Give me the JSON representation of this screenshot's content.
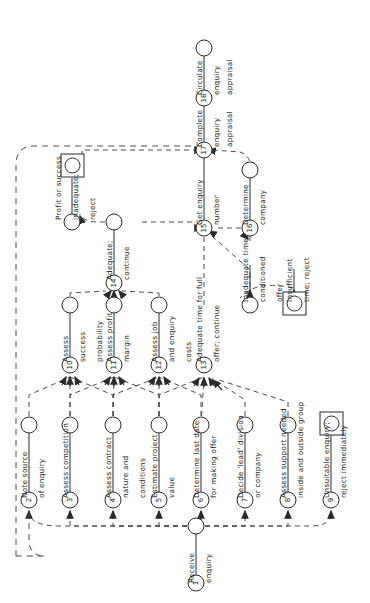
{
  "diagram": {
    "orientation": "rotated-90-ccw",
    "colors": {
      "line": "#2b2b2b",
      "text": "#1a1a1a",
      "background": "#ffffff",
      "dashed": "#4a4a4a"
    },
    "nodes": [
      {
        "id": "1",
        "num": "1",
        "cx": 196,
        "cy": 583,
        "shape": "circle"
      },
      {
        "id": "2",
        "num": "2",
        "cx": 29,
        "cy": 500,
        "shape": "circle"
      },
      {
        "id": "3",
        "num": "3",
        "cx": 70,
        "cy": 500,
        "shape": "circle"
      },
      {
        "id": "4",
        "num": "4",
        "cx": 113,
        "cy": 500,
        "shape": "circle"
      },
      {
        "id": "5",
        "num": "5",
        "cx": 159,
        "cy": 500,
        "shape": "circle"
      },
      {
        "id": "6",
        "num": "6",
        "cx": 201,
        "cy": 500,
        "shape": "circle"
      },
      {
        "id": "7",
        "num": "7",
        "cx": 245,
        "cy": 500,
        "shape": "circle"
      },
      {
        "id": "8",
        "num": "8",
        "cx": 288,
        "cy": 500,
        "shape": "circle"
      },
      {
        "id": "9",
        "num": "9",
        "cx": 331,
        "cy": 500,
        "shape": "circle"
      },
      {
        "id": "10",
        "num": "10",
        "cx": 70,
        "cy": 365,
        "shape": "circle"
      },
      {
        "id": "11",
        "num": "11",
        "cx": 114,
        "cy": 365,
        "shape": "circle"
      },
      {
        "id": "12",
        "num": "12",
        "cx": 159,
        "cy": 365,
        "shape": "circle"
      },
      {
        "id": "13",
        "num": "13",
        "cx": 204,
        "cy": 365,
        "shape": "circle"
      },
      {
        "id": "14",
        "num": "14",
        "cx": 114,
        "cy": 283,
        "shape": "circle"
      },
      {
        "id": "15",
        "num": "15",
        "cx": 204,
        "cy": 228,
        "shape": "circle"
      },
      {
        "id": "16",
        "num": "16",
        "cx": 250,
        "cy": 228,
        "shape": "circle"
      },
      {
        "id": "17",
        "num": "17",
        "cx": 204,
        "cy": 150,
        "shape": "circle"
      },
      {
        "id": "18",
        "num": "18",
        "cx": 204,
        "cy": 98,
        "shape": "circle"
      }
    ],
    "endpoints": [
      {
        "id": "e2",
        "cx": 29,
        "cy": 425,
        "shape": "open-circle"
      },
      {
        "id": "e3",
        "cx": 70,
        "cy": 425,
        "shape": "open-circle"
      },
      {
        "id": "e4",
        "cx": 113,
        "cy": 425,
        "shape": "open-circle"
      },
      {
        "id": "e5",
        "cx": 159,
        "cy": 425,
        "shape": "open-circle"
      },
      {
        "id": "e6",
        "cx": 201,
        "cy": 425,
        "shape": "open-circle"
      },
      {
        "id": "e7",
        "cx": 245,
        "cy": 425,
        "shape": "open-circle"
      },
      {
        "id": "e8",
        "cx": 288,
        "cy": 425,
        "shape": "open-circle"
      },
      {
        "id": "e9",
        "cx": 331,
        "cy": 425,
        "shape": "square-circle"
      },
      {
        "id": "e10",
        "cx": 70,
        "cy": 305,
        "shape": "open-circle"
      },
      {
        "id": "e11",
        "cx": 114,
        "cy": 305,
        "shape": "open-circle"
      },
      {
        "id": "e12",
        "cx": 159,
        "cy": 305,
        "shape": "open-circle"
      },
      {
        "id": "e13a",
        "cx": 250,
        "cy": 305,
        "shape": "open-circle"
      },
      {
        "id": "e13b",
        "cx": 294,
        "cy": 305,
        "shape": "square-circle"
      },
      {
        "id": "e14",
        "cx": 114,
        "cy": 222,
        "shape": "open-circle"
      },
      {
        "id": "e14r",
        "cx": 72,
        "cy": 222,
        "shape": "open-circle"
      },
      {
        "id": "e14x",
        "cx": 72,
        "cy": 165,
        "shape": "square-circle"
      },
      {
        "id": "e16",
        "cx": 250,
        "cy": 170,
        "shape": "open-circle"
      },
      {
        "id": "e1",
        "cx": 196,
        "cy": 526,
        "shape": "open-circle"
      },
      {
        "id": "e18",
        "cx": 204,
        "cy": 48,
        "shape": "open-circle"
      }
    ],
    "activities": [
      {
        "node": "1",
        "line1": "Receive",
        "line2": "enquiry"
      },
      {
        "node": "2",
        "line1": "Note source",
        "line2": "of enquiry"
      },
      {
        "node": "3",
        "line1": "Assess competition",
        "line2": ""
      },
      {
        "node": "4",
        "line1": "Assess contract",
        "line2": "nature and",
        "line3": "conditions"
      },
      {
        "node": "5",
        "line1": "Estimate project",
        "line2": "value"
      },
      {
        "node": "6",
        "line1": "Determine last date",
        "line2": "for making offer"
      },
      {
        "node": "7",
        "line1": "Decide 'lead' division",
        "line2": "or company"
      },
      {
        "node": "8",
        "line1": "Assess support needed",
        "line2": "inside and outside group"
      },
      {
        "node": "9",
        "line1": "Unsuitable enquiry;",
        "line2": "reject immediately"
      },
      {
        "node": "10",
        "line1": "Assess",
        "line2": "success",
        "line3": "probability"
      },
      {
        "node": "11",
        "line1": "Assess profit",
        "line2": "margin"
      },
      {
        "node": "12",
        "line1": "Assess job",
        "line2": "and enquiry",
        "line3": "costs"
      },
      {
        "node": "13",
        "line1": "Adequate time for full",
        "line2": "offer; continue"
      },
      {
        "node": "13b",
        "line1": "Inadequate time;",
        "line2": "conditioned",
        "line3": "offer"
      },
      {
        "node": "13c",
        "line1": "Insufficient",
        "line2": "time; reject"
      },
      {
        "node": "14",
        "line1": "Adequate;",
        "line2": "continue"
      },
      {
        "node": "14b",
        "line1": "Profit or success",
        "line2": "inadequate;",
        "line3": "reject"
      },
      {
        "node": "15",
        "line1": "Get enquiry",
        "line2": "number"
      },
      {
        "node": "16",
        "line1": "Determine",
        "line2": "company"
      },
      {
        "node": "17",
        "line1": "Complete",
        "line2": "enquiry",
        "line3": "appraisal"
      },
      {
        "node": "18",
        "line1": "Circulate",
        "line2": "enquiry",
        "line3": "appraisal"
      }
    ],
    "labels": [
      {
        "id": "t1a",
        "text": "Receive",
        "x": 188,
        "y": 583
      },
      {
        "id": "t1b",
        "text": "enquiry",
        "x": 205,
        "y": 583
      },
      {
        "id": "t2a",
        "text": "Note source",
        "x": 21,
        "y": 498
      },
      {
        "id": "t2b",
        "text": "of enquiry",
        "x": 38,
        "y": 498
      },
      {
        "id": "t3a",
        "text": "Assess competition",
        "x": 62,
        "y": 498
      },
      {
        "id": "t4a",
        "text": "Assess contract",
        "x": 105,
        "y": 498
      },
      {
        "id": "t4b",
        "text": "nature and",
        "x": 122,
        "y": 498
      },
      {
        "id": "t4c",
        "text": "conditions",
        "x": 139,
        "y": 498
      },
      {
        "id": "t5a",
        "text": "Estimate project",
        "x": 151,
        "y": 498
      },
      {
        "id": "t5b",
        "text": "value",
        "x": 168,
        "y": 498
      },
      {
        "id": "t6a",
        "text": "Determine last date",
        "x": 193,
        "y": 498
      },
      {
        "id": "t6b",
        "text": "for making offer",
        "x": 210,
        "y": 498
      },
      {
        "id": "t7a",
        "text": "Decide 'lead' division",
        "x": 237,
        "y": 498
      },
      {
        "id": "t7b",
        "text": "or company",
        "x": 254,
        "y": 498
      },
      {
        "id": "t8a",
        "text": "Assess support needed",
        "x": 280,
        "y": 498
      },
      {
        "id": "t8b",
        "text": "inside and outside group",
        "x": 297,
        "y": 498
      },
      {
        "id": "t9a",
        "text": "Unsuitable enquiry;",
        "x": 323,
        "y": 498
      },
      {
        "id": "t9b",
        "text": "reject immediately",
        "x": 340,
        "y": 498
      },
      {
        "id": "t10a",
        "text": "Assess",
        "x": 62,
        "y": 362
      },
      {
        "id": "t10b",
        "text": "success",
        "x": 79,
        "y": 362
      },
      {
        "id": "t10c",
        "text": "probability",
        "x": 96,
        "y": 362
      },
      {
        "id": "t11a",
        "text": "Assess profit",
        "x": 106,
        "y": 362
      },
      {
        "id": "t11b",
        "text": "margin",
        "x": 123,
        "y": 362
      },
      {
        "id": "t12a",
        "text": "Assess job",
        "x": 151,
        "y": 362
      },
      {
        "id": "t12b",
        "text": "and enquiry",
        "x": 168,
        "y": 362
      },
      {
        "id": "t12c",
        "text": "costs",
        "x": 185,
        "y": 362
      },
      {
        "id": "t13a",
        "text": "Adequate time for full",
        "x": 196,
        "y": 362
      },
      {
        "id": "t13b",
        "text": "offer; continue",
        "x": 213,
        "y": 362
      },
      {
        "id": "t13c",
        "text": "Inadequate time;",
        "x": 242,
        "y": 302
      },
      {
        "id": "t13d",
        "text": "conditioned",
        "x": 259,
        "y": 302
      },
      {
        "id": "t13e",
        "text": "offer",
        "x": 276,
        "y": 302
      },
      {
        "id": "t13f",
        "text": "Insufficient",
        "x": 286,
        "y": 302
      },
      {
        "id": "t13g",
        "text": "time; reject",
        "x": 303,
        "y": 302
      },
      {
        "id": "t14a",
        "text": "Adequate;",
        "x": 106,
        "y": 280
      },
      {
        "id": "t14b",
        "text": "continue",
        "x": 123,
        "y": 280
      },
      {
        "id": "t14c",
        "text": "Profit or success",
        "x": 55,
        "y": 220
      },
      {
        "id": "t14d",
        "text": "inadequate;",
        "x": 72,
        "y": 220
      },
      {
        "id": "t14e",
        "text": "reject",
        "x": 89,
        "y": 220
      },
      {
        "id": "t15a",
        "text": "Get enquiry",
        "x": 196,
        "y": 225
      },
      {
        "id": "t15b",
        "text": "number",
        "x": 213,
        "y": 225
      },
      {
        "id": "t16a",
        "text": "Determine",
        "x": 242,
        "y": 225
      },
      {
        "id": "t16b",
        "text": "company",
        "x": 259,
        "y": 225
      },
      {
        "id": "t17a",
        "text": "Complete",
        "x": 196,
        "y": 147
      },
      {
        "id": "t17b",
        "text": "enquiry",
        "x": 213,
        "y": 147
      },
      {
        "id": "t17c",
        "text": "appraisal",
        "x": 226,
        "y": 147
      },
      {
        "id": "t18a",
        "text": "Circulate",
        "x": 196,
        "y": 95
      },
      {
        "id": "t18b",
        "text": "enquiry",
        "x": 213,
        "y": 95
      },
      {
        "id": "t18c",
        "text": "appraisal",
        "x": 226,
        "y": 95
      }
    ]
  }
}
